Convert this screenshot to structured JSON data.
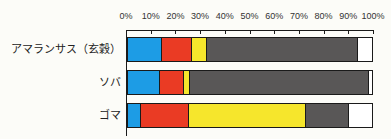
{
  "chart_data": {
    "type": "bar",
    "orientation": "horizontal",
    "stacked": true,
    "title": "",
    "xlabel": "",
    "ylabel": "",
    "legend": "none",
    "grid": false,
    "xlim": [
      0,
      100
    ],
    "x_ticks": [
      "0%",
      "10%",
      "20%",
      "30%",
      "40%",
      "50%",
      "60%",
      "70%",
      "80%",
      "90%",
      "100%"
    ],
    "categories": [
      "アマランサス（玄穀）",
      "ソバ",
      "ゴマ"
    ],
    "series": [
      {
        "name": "blue-segment",
        "color": "#1d9ce5",
        "values": [
          13.5,
          12.5,
          5
        ]
      },
      {
        "name": "red-segment",
        "color": "#ea3b24",
        "values": [
          12.5,
          10,
          19.5
        ]
      },
      {
        "name": "yellow-segment",
        "color": "#f6e62c",
        "values": [
          6,
          2.5,
          48
        ]
      },
      {
        "name": "gray-segment",
        "color": "#595757",
        "values": [
          62,
          73.5,
          17.5
        ]
      },
      {
        "name": "white-segment",
        "color": "#ffffff",
        "values": [
          6,
          1.5,
          10
        ]
      }
    ]
  },
  "layout_colors": {
    "background": "#fcfcf8",
    "axis": "#1a1a1a",
    "tick_label": "#333333",
    "bar_label": "#222222"
  }
}
